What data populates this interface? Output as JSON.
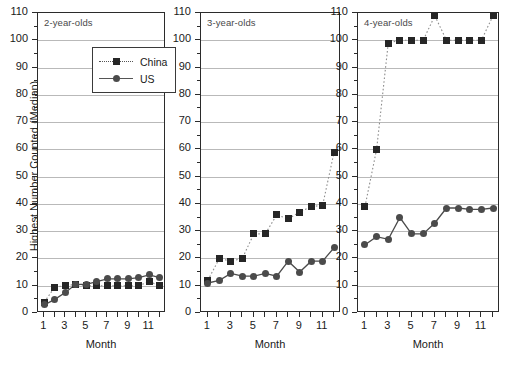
{
  "figure": {
    "ylabel": "Highest Number Counted (Median)",
    "xlabel": "Month"
  },
  "legend": {
    "position": "panel-1-upper-center",
    "entries": [
      {
        "label": "China",
        "marker": "square",
        "line": "dotted",
        "color": "#262626"
      },
      {
        "label": "US",
        "marker": "circle",
        "line": "solid",
        "color": "#4b4b4b"
      }
    ]
  },
  "axis": {
    "y_ticks": [
      0,
      10,
      20,
      30,
      40,
      50,
      60,
      70,
      80,
      90,
      100,
      110
    ],
    "x_ticks": [
      1,
      2,
      3,
      4,
      5,
      6,
      7,
      8,
      9,
      10,
      11,
      12
    ],
    "x_tick_labels": [
      "1",
      "",
      "3",
      "",
      "5",
      "",
      "7",
      "",
      "9",
      "",
      "11",
      ""
    ]
  },
  "chart_data": [
    {
      "type": "line",
      "title": "2-year-olds",
      "xlabel": "Month",
      "ylabel": "Highest Number Counted (Median)",
      "xlim": [
        0.4,
        12.6
      ],
      "ylim": [
        0,
        110
      ],
      "grid": true,
      "x": [
        1,
        2,
        3,
        4,
        5,
        6,
        7,
        8,
        9,
        10,
        11,
        12
      ],
      "series": [
        {
          "name": "China",
          "marker": "square",
          "line": "dotted",
          "values": [
            4,
            9.5,
            10,
            10.5,
            10,
            10,
            10,
            10,
            10,
            10,
            11.5,
            10
          ]
        },
        {
          "name": "US",
          "marker": "circle",
          "line": "solid",
          "values": [
            3,
            5,
            7.5,
            10.5,
            10.5,
            11.5,
            12.5,
            12.5,
            12.5,
            13,
            14,
            13
          ]
        }
      ]
    },
    {
      "type": "line",
      "title": "3-year-olds",
      "xlabel": "Month",
      "ylabel": "Highest Number Counted (Median)",
      "xlim": [
        0.4,
        12.6
      ],
      "ylim": [
        0,
        110
      ],
      "grid": true,
      "x": [
        1,
        2,
        3,
        4,
        5,
        6,
        7,
        8,
        9,
        10,
        11,
        12
      ],
      "series": [
        {
          "name": "China",
          "marker": "square",
          "line": "dotted",
          "values": [
            12,
            20,
            19,
            20,
            29,
            29,
            36,
            34.5,
            37,
            39,
            39.5,
            59
          ]
        },
        {
          "name": "US",
          "marker": "circle",
          "line": "solid",
          "values": [
            11,
            12,
            14.5,
            13.5,
            13.5,
            14.5,
            13.5,
            19,
            15,
            19,
            19,
            24
          ]
        }
      ]
    },
    {
      "type": "line",
      "title": "4-year-olds",
      "xlabel": "Month",
      "ylabel": "Highest Number Counted (Median)",
      "xlim": [
        0.4,
        12.6
      ],
      "ylim": [
        0,
        110
      ],
      "grid": true,
      "x": [
        1,
        2,
        3,
        4,
        5,
        6,
        7,
        8,
        9,
        10,
        11,
        12
      ],
      "series": [
        {
          "name": "China",
          "marker": "square",
          "line": "dotted",
          "values": [
            39,
            60,
            99,
            100,
            100,
            100,
            109,
            100,
            100,
            100,
            100,
            109
          ]
        },
        {
          "name": "US",
          "marker": "circle",
          "line": "solid",
          "values": [
            25,
            28,
            27,
            35,
            29,
            29,
            33,
            38.5,
            38.5,
            38,
            38,
            38.5
          ]
        }
      ]
    }
  ]
}
